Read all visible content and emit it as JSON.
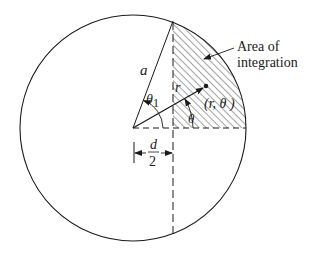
{
  "diagram": {
    "labels": {
      "radius": "a",
      "theta1": "θ",
      "theta1_sub": "1",
      "r": "r",
      "point": "(r, θ )",
      "theta": "θ",
      "d_num": "d",
      "d_den": "2",
      "area_line1": "Area of",
      "area_line2": "integration"
    },
    "geometry": {
      "center": [
        133,
        128
      ],
      "radius": 113,
      "vertical_line_x": 173,
      "point": [
        206,
        86
      ]
    },
    "colors": {
      "stroke": "#1a1a1a",
      "hatch": "#333333",
      "background": "#ffffff"
    }
  }
}
